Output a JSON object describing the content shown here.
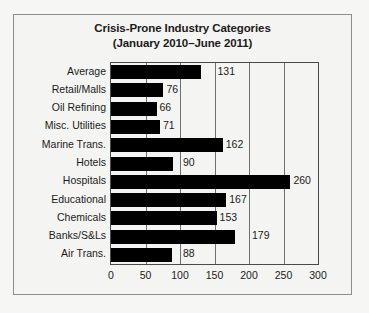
{
  "chart_data": {
    "type": "bar",
    "orientation": "horizontal",
    "title": "Crisis-Prone Industry Categories",
    "subtitle": "(January 2010–June 2011)",
    "xlabel": "",
    "ylabel": "",
    "xlim": [
      0,
      300
    ],
    "xticks": [
      0,
      50,
      100,
      150,
      200,
      250,
      300
    ],
    "xtick_labels": [
      "0",
      "50",
      "100",
      "150",
      "200",
      "250",
      "300"
    ],
    "grid": true,
    "grid_axis": "x",
    "legend": false,
    "bar_color": "#000000",
    "categories": [
      "Average",
      "Retail/Malls",
      "Oil Refining",
      "Misc. Utilities",
      "Marine Trans.",
      "Hotels",
      "Hospitals",
      "Educational",
      "Chemicals",
      "Banks/S&Ls",
      "Air Trans."
    ],
    "values": [
      131,
      76,
      66,
      71,
      162,
      90,
      260,
      167,
      153,
      179,
      88
    ],
    "value_labels": [
      "131",
      "76",
      "66",
      "71",
      "162",
      "90",
      "260",
      "167",
      "153",
      "179",
      "88"
    ]
  }
}
